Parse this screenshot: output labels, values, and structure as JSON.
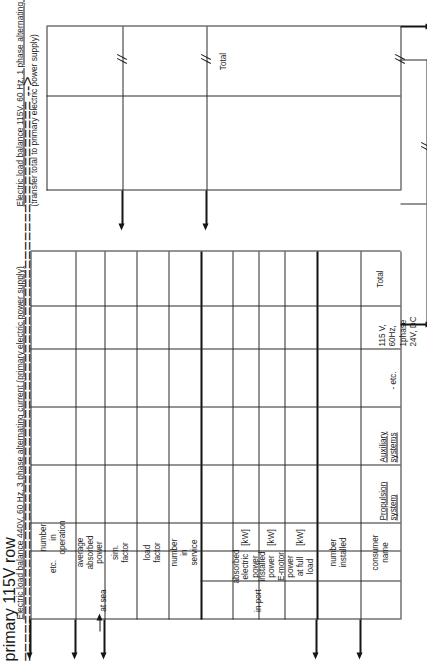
{
  "document": {
    "orientation": "rotated-90-ccw",
    "kind": "engineering-worksheet"
  },
  "table_primary": {
    "title": "Electric load balance 440V, 60 Hz, 3 phase alternating current (primary electric power supply)",
    "group_headers": [
      {
        "label": "in port"
      },
      {
        "label": "at sea"
      }
    ],
    "columns": [
      {
        "key": "consumer_name",
        "header": "consumer name",
        "unit": ""
      },
      {
        "key": "number_installed",
        "header": "number\ninstalled",
        "unit": ""
      },
      {
        "key": "power_full_load",
        "header": "power\nat full\nload",
        "unit": "[kW]"
      },
      {
        "key": "installed_power",
        "header": "installed\npower\nE-motor",
        "unit": "[kW]"
      },
      {
        "key": "absorbed_power",
        "header": "absorbed\nelectric\npower",
        "unit": "[kW]"
      },
      {
        "key": "port_number",
        "header": "number\nin\nservice",
        "unit": "",
        "group": "in port"
      },
      {
        "key": "port_load_factor",
        "header": "load\nfactor",
        "unit": "",
        "group": "in port"
      },
      {
        "key": "port_sim_factor",
        "header": "sim.\nfactor",
        "unit": "",
        "group": "in port"
      },
      {
        "key": "port_avg_absorbed",
        "header": "average\nabsorbed\npower",
        "unit": "",
        "group": "in port"
      },
      {
        "key": "sea_number",
        "header": "number\nin\noperation",
        "unit": "",
        "group": "at sea"
      },
      {
        "key": "sea_etc",
        "header": "etc.",
        "unit": "",
        "group": "at sea"
      }
    ],
    "rows": [
      {
        "label": "Propulsion system",
        "underline": true,
        "dots": ".   .   ."
      },
      {
        "label": "Auxiliary systems",
        "underline": true,
        "dots": ".   .   ."
      },
      {
        "label": "- etc.",
        "underline": false,
        "dots": ""
      },
      {
        "label": "115 V, 60Hz, 1phase\n24V, DC",
        "underline": false,
        "dots": ""
      }
    ],
    "total_row_label": "Total"
  },
  "table_secondary": {
    "title": "Electric load balance 115V, 60 Hz, 1 phase alternating current (secondary electric power supply)",
    "subtitle": "(transfer total to primary electric power supply)",
    "total_row_label": "Total"
  },
  "annotations": {
    "break_mark_name": "break-mark",
    "arrow_up_name": "arrow-up",
    "transfer_connector_name": "transfer-connector"
  },
  "colors": {
    "ink": "#1c1c1c",
    "rule": "#2b2b2b",
    "rule_thick": "#111111",
    "paper": "#ffffff"
  }
}
